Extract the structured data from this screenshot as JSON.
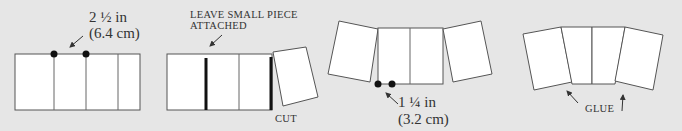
{
  "diagram": {
    "background": "#e6e6e6",
    "stroke_color": "#555555",
    "panel_fill": "#ffffff",
    "steps": [
      {
        "id": "step-1",
        "labels": {
          "measure_in": "2 ½ in",
          "measure_cm": "(6.4 cm)"
        }
      },
      {
        "id": "step-2",
        "labels": {
          "note_line1": "LEAVE SMALL PIECE",
          "note_line2": "ATTACHED",
          "cut": "CUT"
        }
      },
      {
        "id": "step-3",
        "labels": {
          "measure_in": "1 ¼ in",
          "measure_cm": "(3.2 cm)"
        }
      },
      {
        "id": "step-4",
        "labels": {
          "glue": "GLUE"
        }
      }
    ]
  }
}
